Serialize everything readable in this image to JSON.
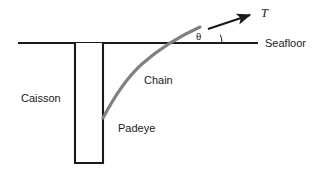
{
  "figure": {
    "type": "engineering-diagram",
    "background_color": "#ffffff",
    "line_color": "#1a1a1a",
    "chain_color": "#808080"
  },
  "labels": {
    "seafloor": "Seafloor",
    "caisson": "Caisson",
    "chain": "Chain",
    "padeye": "Padeye",
    "angle": "θ",
    "tension": "T"
  },
  "geometry": {
    "seafloor_line": {
      "x1": 18,
      "y1": 43,
      "x2": 258,
      "y2": 43
    },
    "caisson_rect": {
      "x": 75,
      "y": 43,
      "width": 28,
      "height": 120
    },
    "chain_path": "M 103 118 C 112 101, 124 80, 142 64 C 160 48, 180 36, 200 27",
    "tension_arrow": {
      "x1": 208,
      "y1": 29,
      "x2": 253,
      "y2": 14
    },
    "angle_arc": {
      "cx": 200,
      "cy": 43,
      "r": 22,
      "start_deg": 0,
      "end_deg": 22
    }
  },
  "label_positions": {
    "seafloor": {
      "x": 265,
      "y": 47
    },
    "caisson": {
      "x": 21,
      "y": 102
    },
    "chain": {
      "x": 144,
      "y": 84
    },
    "padeye": {
      "x": 118,
      "y": 132
    },
    "angle": {
      "x": 195,
      "y": 40
    },
    "tension": {
      "x": 261,
      "y": 17
    }
  }
}
